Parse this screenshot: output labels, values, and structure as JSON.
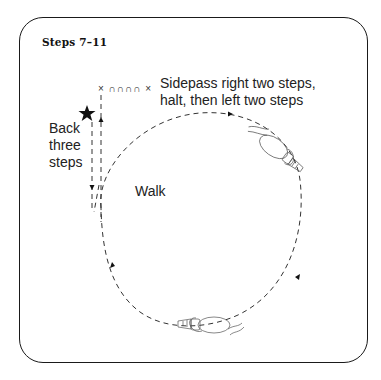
{
  "title": "Steps 7–11",
  "labels": {
    "sidepass_line1": "Sidepass right two steps,",
    "sidepass_line2": "halt, then left two steps",
    "back_line1": "Back",
    "back_line2": "three",
    "back_line3": "steps",
    "walk": "Walk"
  },
  "marks": "× ∩∩∩∩ ×",
  "icons": {
    "start": "star-icon",
    "horse_top": "horse-icon",
    "horse_bottom": "horse-icon"
  },
  "colors": {
    "line": "#1a1a1a",
    "path": "#333333",
    "background": "#ffffff"
  }
}
